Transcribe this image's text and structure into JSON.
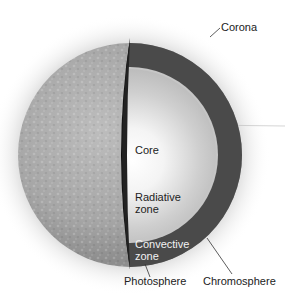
{
  "diagram": {
    "labels": {
      "corona": "Corona",
      "core": "Core",
      "radiative_line1": "Radiative",
      "radiative_line2": "zone",
      "convective_line1": "Convective",
      "convective_line2": "zone",
      "photosphere": "Photosphere",
      "chromosphere": "Chromosphere"
    },
    "colors": {
      "background": "#ffffff",
      "surface": "#a9a9a9",
      "convective_band": "#4a4a4a",
      "radiative_zone": "#c8c8c8",
      "core_center": "#ffffff",
      "cut_edge": "#111111",
      "label_text": "#222222",
      "label_text_on_dark": "#f2f2f2"
    }
  }
}
